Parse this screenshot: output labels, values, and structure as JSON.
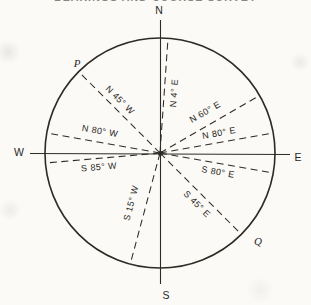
{
  "title": {
    "clipped_text": "BEARINGS AND COURSE SURVEY"
  },
  "colors": {
    "line": "#2e2b26",
    "text": "#2a2723",
    "background": "#fbfaf7"
  },
  "diagram": {
    "circle": {
      "cx": 160,
      "cy": 153,
      "r": 115
    },
    "axes": [
      {
        "id": "north-south-line",
        "x1": 160.5,
        "y1": 20,
        "x2": 160.5,
        "y2": 284
      },
      {
        "id": "west-east-line",
        "x1": 30,
        "y1": 153.5,
        "x2": 290,
        "y2": 154.5
      }
    ],
    "cardinals": [
      {
        "id": "north",
        "label": "N",
        "x": 159,
        "y": 10
      },
      {
        "id": "south",
        "label": "S",
        "x": 166,
        "y": 295
      },
      {
        "id": "west",
        "label": "W",
        "x": 19,
        "y": 152
      },
      {
        "id": "east",
        "label": "E",
        "x": 298,
        "y": 157
      }
    ],
    "rays": [
      {
        "id": "n45w",
        "label": "N 45° W",
        "quadrant": "NW",
        "angle": 45,
        "labelPos": [
          120,
          100
        ],
        "labelRot": 45
      },
      {
        "id": "n4e",
        "label": "N 4° E",
        "quadrant": "NE",
        "angle": 4,
        "labelPos": [
          174,
          93
        ],
        "labelRot": -86
      },
      {
        "id": "n60e",
        "label": "N 60° E",
        "quadrant": "NE",
        "angle": 60,
        "labelPos": [
          205,
          112
        ],
        "labelRot": -30
      },
      {
        "id": "n80e",
        "label": "N 80° E",
        "quadrant": "NE",
        "angle": 80,
        "labelPos": [
          219,
          133
        ],
        "labelRot": -10
      },
      {
        "id": "s80e",
        "label": "S 80° E",
        "quadrant": "SE",
        "angle": 80,
        "labelPos": [
          218,
          172
        ],
        "labelRot": 10
      },
      {
        "id": "s45e",
        "label": "S 45° E",
        "quadrant": "SE",
        "angle": 45,
        "labelPos": [
          197,
          204
        ],
        "labelRot": 45
      },
      {
        "id": "s15w",
        "label": "S 15° W",
        "quadrant": "SW",
        "angle": 15,
        "labelPos": [
          131,
          203
        ],
        "labelRot": -75
      },
      {
        "id": "s85w",
        "label": "S 85° W",
        "quadrant": "SW",
        "angle": 85,
        "labelPos": [
          99,
          167
        ],
        "labelRot": -5
      },
      {
        "id": "n80w",
        "label": "N 80° W",
        "quadrant": "NW",
        "angle": 80,
        "labelPos": [
          100,
          131
        ],
        "labelRot": 10
      }
    ],
    "points": [
      {
        "id": "point-p",
        "label": "P",
        "x": 77,
        "y": 63
      },
      {
        "id": "point-q",
        "label": "Q",
        "x": 258,
        "y": 241
      }
    ]
  }
}
